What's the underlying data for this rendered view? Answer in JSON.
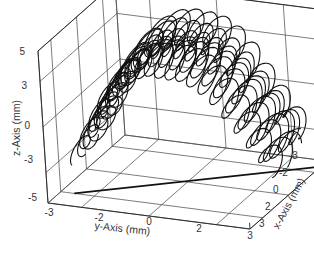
{
  "chart_data": {
    "type": "line3d",
    "title": "",
    "xlabel": "x-Axis (mm)",
    "ylabel": "y-Axis (mm)",
    "zlabel": "z-Axis (mm)",
    "xlim": [
      -3,
      3
    ],
    "ylim": [
      -3,
      3
    ],
    "zlim": [
      -5,
      5
    ],
    "x_ticks": [
      "-3",
      "-2",
      "0",
      "2",
      "3"
    ],
    "y_ticks": [
      "-3",
      "-2",
      "0",
      "2",
      "3"
    ],
    "z_ticks": [
      "5",
      "3",
      "0",
      "-3",
      "-5"
    ],
    "grid": true,
    "legend": null,
    "series": [
      {
        "name": "trajectory",
        "points_yz_approx": [
          {
            "y": -3.0,
            "z": -3.0
          },
          {
            "y": -2.5,
            "z": -1.0
          },
          {
            "y": -2.0,
            "z": 1.0
          },
          {
            "y": -1.5,
            "z": 2.5
          },
          {
            "y": -1.0,
            "z": 3.5
          },
          {
            "y": -0.5,
            "z": 4.0
          },
          {
            "y": 0.0,
            "z": 4.0
          },
          {
            "y": 0.5,
            "z": 4.0
          },
          {
            "y": 1.0,
            "z": 3.5
          },
          {
            "y": 1.5,
            "z": 2.5
          },
          {
            "y": 2.0,
            "z": 1.0
          },
          {
            "y": 2.5,
            "z": -0.5
          },
          {
            "y": 3.0,
            "z": -2.0
          }
        ]
      },
      {
        "name": "floor-line",
        "points": [
          {
            "x": 2.0,
            "y": -2.6,
            "z": -5
          },
          {
            "x": -2.5,
            "y": 3.0,
            "z": -5
          }
        ]
      }
    ]
  }
}
